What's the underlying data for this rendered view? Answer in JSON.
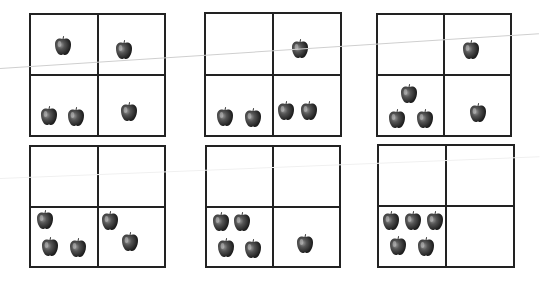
{
  "worksheet": {
    "description": "Ten-frame style counting grids with apples",
    "apple_color": "#3a3a3a",
    "grids": [
      {
        "id": 1,
        "cells": {
          "top_left": 1,
          "top_right": 1,
          "bottom_left": 2,
          "bottom_right": 1
        }
      },
      {
        "id": 2,
        "cells": {
          "top_left": 0,
          "top_right": 1,
          "bottom_left": 2,
          "bottom_right": 2
        }
      },
      {
        "id": 3,
        "cells": {
          "top_left": 0,
          "top_right": 1,
          "bottom_left": 3,
          "bottom_right": 1
        }
      },
      {
        "id": 4,
        "cells": {
          "top_left": 0,
          "top_right": 0,
          "bottom_left": 3,
          "bottom_right": 2
        }
      },
      {
        "id": 5,
        "cells": {
          "top_left": 0,
          "top_right": 0,
          "bottom_left": 4,
          "bottom_right": 1
        }
      },
      {
        "id": 6,
        "cells": {
          "top_left": 0,
          "top_right": 0,
          "bottom_left": 5,
          "bottom_right": 0
        }
      }
    ]
  }
}
